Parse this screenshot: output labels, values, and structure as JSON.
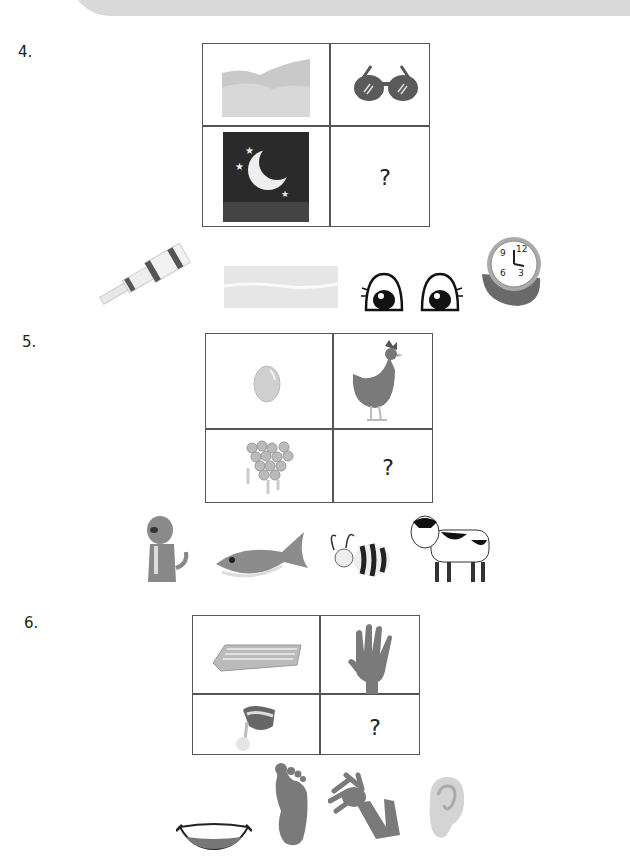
{
  "worksheet": {
    "questions": [
      {
        "number": "4.",
        "grid": {
          "top_left": "sand-dunes",
          "top_right": "sunglasses",
          "bottom_left": "night-moon-stars",
          "bottom_right": "?"
        },
        "options": [
          "telescope",
          "water-waves",
          "eyes",
          "wristwatch"
        ]
      },
      {
        "number": "5.",
        "grid": {
          "top_left": "egg",
          "top_right": "hen",
          "bottom_left": "honeycomb",
          "bottom_right": "?"
        },
        "options": [
          "dog",
          "fish",
          "bee",
          "cow"
        ]
      },
      {
        "number": "6.",
        "grid": {
          "top_left": "keyboard",
          "top_right": "hand",
          "bottom_left": "hand-mixer",
          "bottom_right": "?"
        },
        "options": [
          "mouth",
          "foot",
          "arm",
          "ear"
        ]
      }
    ]
  }
}
